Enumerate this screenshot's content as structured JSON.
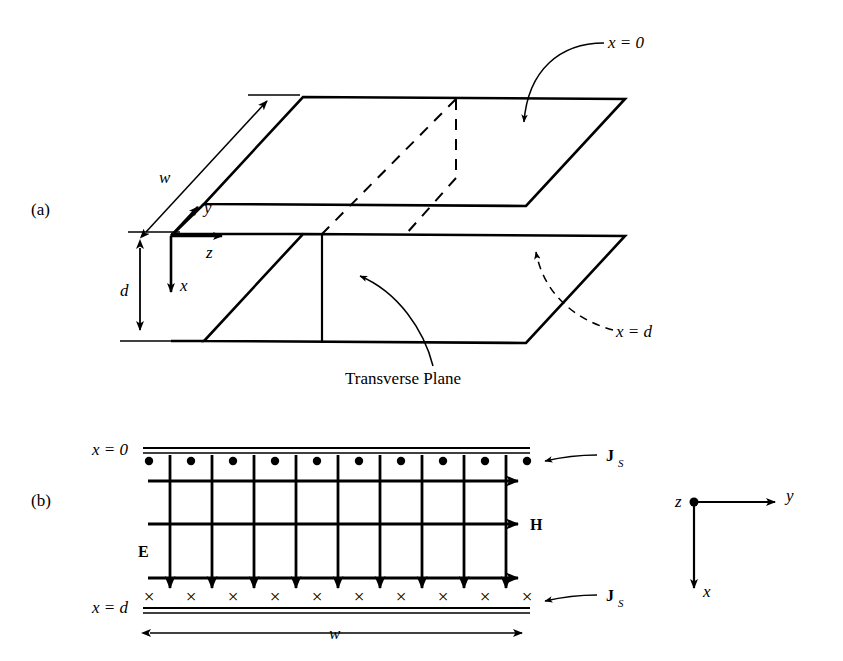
{
  "figure": {
    "stroke_color": "#000000",
    "background_color": "#ffffff"
  },
  "panel_a": {
    "label": "(a)",
    "labels": {
      "x_equals_0": "x = 0",
      "x_equals_d": "x = d",
      "transverse_plane": "Transverse Plane",
      "width_dim": "w",
      "depth_dim": "d",
      "axis_x": "x",
      "axis_y": "y",
      "axis_z": "z"
    }
  },
  "panel_b": {
    "label": "(b)",
    "labels": {
      "x_equals_0": "x = 0",
      "x_equals_d": "x = d",
      "field_E": "E",
      "field_H": "H",
      "surface_current_top": "J",
      "surface_current_top_sub": "S",
      "surface_current_bottom": "J",
      "surface_current_bottom_sub": "S",
      "width_dim": "w"
    },
    "grid": {
      "e_line_count": 9,
      "h_line_count": 3,
      "top_dot_count": 10,
      "bottom_cross_count": 10,
      "dot_symbol": "•",
      "cross_symbol": "×"
    }
  },
  "axis_inset": {
    "labels": {
      "axis_z": "z",
      "axis_y": "y",
      "axis_x": "x"
    }
  }
}
